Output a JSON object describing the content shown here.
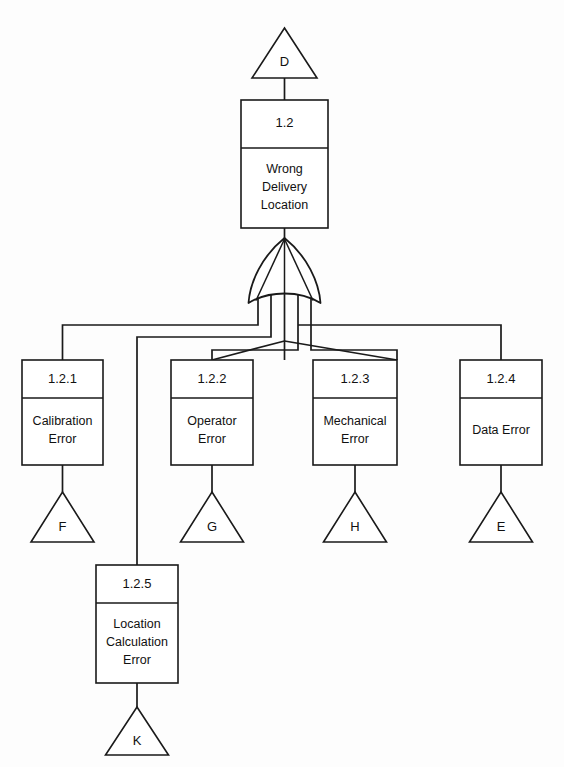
{
  "diagram": {
    "type": "fault-tree",
    "gate": {
      "kind": "or-gate",
      "name": "or-gate-1-2",
      "inputs": 5
    },
    "colors": {
      "background": "#fdfdfd",
      "line": "#1a1a1a",
      "box_fill": "#ffffff",
      "text": "#111111"
    },
    "transfer_in": {
      "label": "D",
      "shape": "triangle"
    },
    "top_event": {
      "id": "1.2",
      "description_lines": [
        "Wrong",
        "Delivery",
        "Location"
      ]
    },
    "events": [
      {
        "id": "1.2.1",
        "description_lines": [
          "Calibration",
          "Error"
        ],
        "transfer_out": "F"
      },
      {
        "id": "1.2.2",
        "description_lines": [
          "Operator",
          "Error"
        ],
        "transfer_out": "G"
      },
      {
        "id": "1.2.3",
        "description_lines": [
          "Mechanical",
          "Error"
        ],
        "transfer_out": "H"
      },
      {
        "id": "1.2.4",
        "description_lines": [
          "Data Error"
        ],
        "transfer_out": "E"
      },
      {
        "id": "1.2.5",
        "description_lines": [
          "Location",
          "Calculation",
          "Error"
        ],
        "transfer_out": "K"
      }
    ]
  }
}
